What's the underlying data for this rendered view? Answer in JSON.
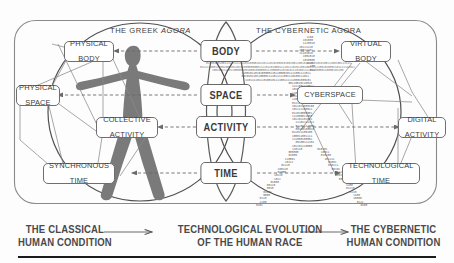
{
  "diagram": {
    "title_left": "THE CLASSICAL HUMAN CONDITION",
    "agora_left_prefix": "THE GREEK ",
    "agora_left_italic": "AGORA",
    "agora_right": "THE CYBERNETIC AGORA",
    "center_column": [
      {
        "id": "body",
        "label": "BODY"
      },
      {
        "id": "space",
        "label": "SPACE"
      },
      {
        "id": "activity",
        "label": "ACTIVITY"
      },
      {
        "id": "time",
        "label": "TIME"
      }
    ],
    "left_nodes": [
      {
        "id": "physical-body",
        "line1": "PHYSICAL",
        "line2": "BODY"
      },
      {
        "id": "physical-space",
        "line1": "PHYSICAL",
        "line2": "SPACE"
      },
      {
        "id": "collective-activity",
        "line1": "COLLECTIVE",
        "line2": "ACTIVITY"
      },
      {
        "id": "synchronous-time",
        "line1": "SYNCHRONOUS",
        "line2": "TIME"
      }
    ],
    "right_nodes": [
      {
        "id": "virtual-body",
        "line1": "VIRTUAL",
        "line2": "BODY"
      },
      {
        "id": "cyberspace",
        "line1": "CYBERSPACE",
        "line2": ""
      },
      {
        "id": "digital-activity",
        "line1": "DIGITAL",
        "line2": "ACTIVITY"
      },
      {
        "id": "technological-time",
        "line1": "TECHNOLOGICAL",
        "line2": "TIME"
      }
    ],
    "caption": {
      "left_line1": "THE CLASSICAL",
      "left_line2": "HUMAN CONDITION",
      "middle_line1": "TECHNOLOGICAL EVOLUTION",
      "middle_line2": "OF THE HUMAN RACE",
      "right_line1": "THE CYBERNETIC",
      "right_line2": "HUMAN CONDITION"
    },
    "figures": {
      "left": "human-silhouette",
      "right": "binary-human-silhouette"
    },
    "colors": {
      "silhouette": "#7a7a7a",
      "binary_text": "#5d5d5d",
      "outline": "#6f6f6f",
      "text": "#3c3c3c",
      "rule": "#1b1b1b",
      "background": "#fdfdfd"
    }
  }
}
